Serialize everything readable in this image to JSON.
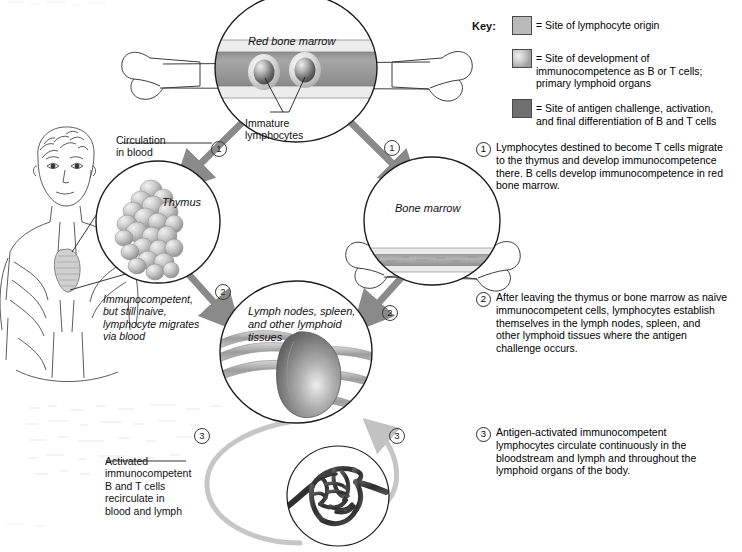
{
  "key": {
    "label": "Key:",
    "items": [
      {
        "swatch": "light-gray",
        "color": "#b9b9b9",
        "text": "= Site of lymphocyte origin"
      },
      {
        "swatch": "mottled-gray",
        "color": "#c9c9c9",
        "text": "= Site of development of\n   immunocompetence as B or T cells;\n   primary lymphoid organs"
      },
      {
        "swatch": "dark-gray",
        "color": "#6f6f6f",
        "text": "= Site of antigen challenge, activation,\n   and final differentiation of B and T cells"
      }
    ]
  },
  "steps": [
    {
      "number": "1",
      "text": "Lymphocytes destined to become T cells migrate\nto the thymus and develop immunocompetence\nthere. B cells develop immunocompetence in red\nbone marrow."
    },
    {
      "number": "2",
      "text": "After leaving the thymus or bone marrow as naive\nimmunocompetent cells, lymphocytes establish\nthemselves in the lymph nodes, spleen, and\nother lymphoid tissues where the antigen\nchallenge occurs."
    },
    {
      "number": "3",
      "text": "Antigen-activated immunocompetent\nlymphocytes circulate continuously in the\nbloodstream and lymph and throughout the\nlymphoid organs of the body."
    }
  ],
  "organs": {
    "red_bone_marrow": "Red bone marrow",
    "thymus": "Thymus",
    "bone_marrow": "Bone marrow",
    "lymph_nodes": "Lymph nodes, spleen,\nand other lymphoid\ntissues"
  },
  "callouts": {
    "immature_lymphocytes": "Immature\nlymphocytes",
    "circulation_in_blood": "Circulation\nin blood",
    "immunocompetent_naive": "Immunocompetent,\nbut still naive,\nlymphocyte migrates\nvia blood",
    "activated_cells": "Activated\nimmunocompetent\nB and T cells\nrecirculate in\nblood and lymph"
  },
  "flow_numbers": {
    "left_one": "1",
    "right_one": "1",
    "left_two": "2",
    "right_two": "2",
    "left_three": "3",
    "right_three": "3"
  },
  "colors": {
    "arrow_gray": "#8a8a8a",
    "loop_gray": "#c6c6c6",
    "outline": "#1d1d1d",
    "marrow_band": "#a2a2a2"
  }
}
